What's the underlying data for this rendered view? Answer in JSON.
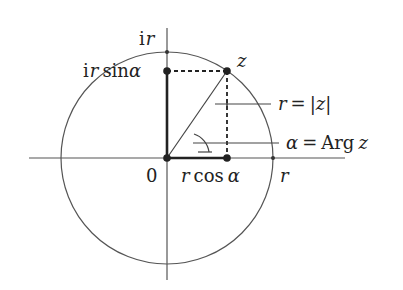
{
  "diagram": {
    "type": "complex-plane-polar-form",
    "colors": {
      "ink": "#333333",
      "thin": "#555555",
      "background": "#ffffff"
    },
    "labels": {
      "imag_r": "i r",
      "imag_r_i": "i",
      "imag_r_r": "r",
      "imag_projection_i": "i",
      "imag_projection_r": "r",
      "imag_projection_sin": "sin",
      "imag_projection_alpha": "α",
      "point_z": "z",
      "modulus_r": "r",
      "modulus_eq": "=",
      "modulus_z": "|z|",
      "argument_alpha": "α",
      "argument_eq": "=",
      "argument_arg": "Arg",
      "argument_z": "z",
      "origin": "0",
      "real_projection_r": "r",
      "real_projection_cos": "cos",
      "real_projection_alpha": "α",
      "real_r": "r"
    }
  }
}
